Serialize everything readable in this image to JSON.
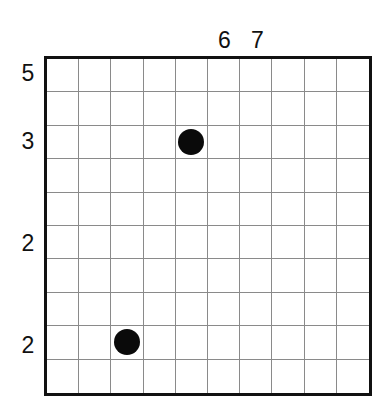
{
  "puzzle": {
    "rows": 10,
    "cols": 10,
    "column_clues": [
      {
        "col": 5,
        "label": "6"
      },
      {
        "col": 6,
        "label": "7"
      }
    ],
    "row_clues": [
      {
        "row": 0,
        "label": "5"
      },
      {
        "row": 2,
        "label": "3"
      },
      {
        "row": 5,
        "label": "2"
      },
      {
        "row": 8,
        "label": "2"
      }
    ],
    "stones": [
      {
        "row": 2,
        "col": 4,
        "icon": "filled-circle-icon"
      },
      {
        "row": 8,
        "col": 2,
        "icon": "filled-circle-icon"
      }
    ],
    "colors": {
      "stone": "#0a0a0a",
      "border": "#111111",
      "grid_line": "#8a8a8a",
      "background": "#ffffff"
    }
  }
}
